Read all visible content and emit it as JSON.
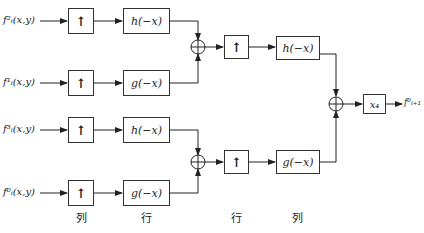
{
  "diagram": {
    "type": "2D inverse wavelet reconstruction block diagram",
    "inputs": [
      {
        "label": "f²ᵢ(x,y)",
        "base": "f",
        "sup": "²",
        "sub": "ᵢ",
        "arg": "(x,y)"
      },
      {
        "label": "f¹ᵢ(x,y)",
        "base": "f",
        "sup": "¹",
        "sub": "ᵢ",
        "arg": "(x,y)"
      },
      {
        "label": "f³ᵢ(x,y)",
        "base": "f",
        "sup": "³",
        "sub": "ᵢ",
        "arg": "(x,y)"
      },
      {
        "label": "f⁰ᵢ(x,y)",
        "base": "f",
        "sup": "⁰",
        "sub": "ᵢ",
        "arg": "(x,y)"
      }
    ],
    "upsample_symbol": "↑",
    "filters": {
      "row1": "h(−x)",
      "row2": "g(−x)",
      "row3": "h(−x)",
      "row4": "g(−x)",
      "col_top": "h(−x)",
      "col_bottom": "g(−x)"
    },
    "adder_symbol": "+",
    "gain": {
      "label": "x₄"
    },
    "output": {
      "label": "f⁰ᵢ₊₁",
      "base": "f",
      "sup": "⁰",
      "sub": "ᵢ₊₁"
    },
    "stage_labels": [
      "列",
      "行",
      "行",
      "列"
    ]
  }
}
